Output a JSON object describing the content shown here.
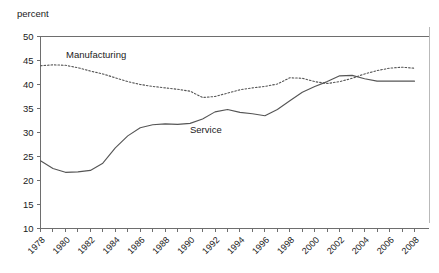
{
  "chart_data": {
    "type": "line",
    "title": "",
    "subtitle": "",
    "xlabel": "",
    "ylabel": "percent",
    "ylim": [
      10,
      50
    ],
    "xlim": [
      1978,
      2008
    ],
    "grid": false,
    "legend_position": "inline-annotation",
    "y_ticks": [
      10,
      15,
      20,
      25,
      30,
      35,
      40,
      45,
      50
    ],
    "x_ticks": [
      1978,
      1980,
      1982,
      1984,
      1986,
      1988,
      1990,
      1992,
      1994,
      1996,
      1998,
      2000,
      2002,
      2004,
      2006,
      2008
    ],
    "x_minor_ticks": [
      1979,
      1981,
      1983,
      1985,
      1987,
      1989,
      1991,
      1993,
      1995,
      1997,
      1999,
      2001,
      2003,
      2005,
      2007
    ],
    "x": [
      1978,
      1979,
      1980,
      1981,
      1982,
      1983,
      1984,
      1985,
      1986,
      1987,
      1988,
      1989,
      1990,
      1991,
      1992,
      1993,
      1994,
      1995,
      1996,
      1997,
      1998,
      1999,
      2000,
      2001,
      2002,
      2003,
      2004,
      2005,
      2006,
      2007,
      2008
    ],
    "series": [
      {
        "name": "Manufacturing",
        "style": "dotted",
        "color": "#555555",
        "annotation": "Manufacturing",
        "values": [
          43.9,
          44.1,
          44.0,
          43.5,
          42.8,
          42.2,
          41.4,
          40.6,
          40.0,
          39.6,
          39.3,
          39.0,
          38.6,
          37.3,
          37.5,
          38.2,
          38.9,
          39.3,
          39.6,
          40.1,
          41.4,
          41.3,
          40.6,
          40.2,
          40.6,
          41.3,
          42.2,
          42.9,
          43.4,
          43.6,
          43.4
        ]
      },
      {
        "name": "Service",
        "style": "solid",
        "color": "#555555",
        "annotation": "Service",
        "values": [
          24.1,
          22.5,
          21.7,
          21.8,
          22.1,
          23.6,
          26.8,
          29.3,
          31.0,
          31.6,
          31.8,
          31.7,
          31.9,
          32.8,
          34.3,
          34.8,
          34.2,
          33.9,
          33.5,
          34.8,
          36.6,
          38.4,
          39.6,
          40.6,
          41.8,
          41.9,
          41.2,
          40.7,
          40.7,
          40.7,
          40.7
        ]
      }
    ]
  }
}
